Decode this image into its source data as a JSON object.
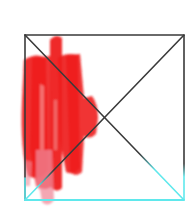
{
  "drawing": {
    "description": "Hand-drawn square with diagonal X, red marker scribble on left side",
    "colors": {
      "background": "#ffffff",
      "outline": "#3a3a3a",
      "outline_bottom": "#5fe8ec",
      "scribble": "#ee1c1c",
      "scribble_faded": "#f08a9a"
    },
    "square": {
      "x1": 25,
      "y1": 35,
      "x2": 184,
      "y2": 200
    },
    "cyan_transition_y": 168,
    "scribble_strokes": [
      {
        "x": 22,
        "y": 58,
        "w": 26,
        "h": 130
      },
      {
        "x": 30,
        "y": 55,
        "w": 22,
        "h": 135
      },
      {
        "x": 50,
        "y": 36,
        "w": 12,
        "h": 150
      },
      {
        "x": 58,
        "y": 55,
        "w": 22,
        "h": 125
      },
      {
        "x": 68,
        "y": 52,
        "w": 12,
        "h": 118
      },
      {
        "x": 78,
        "y": 90,
        "w": 20,
        "h": 48
      },
      {
        "x": 42,
        "y": 160,
        "w": 10,
        "h": 45
      }
    ]
  }
}
